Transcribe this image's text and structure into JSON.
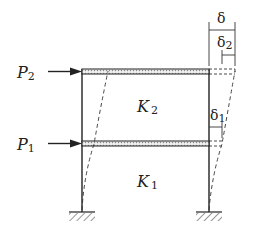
{
  "diagram": {
    "type": "two-story frame lateral deflection",
    "loads": [
      {
        "label": "P",
        "sub": "2",
        "level": "top floor"
      },
      {
        "label": "P",
        "sub": "1",
        "level": "first floor"
      }
    ],
    "stiffness": [
      {
        "label": "K",
        "sub": "2",
        "story": "upper"
      },
      {
        "label": "K",
        "sub": "1",
        "story": "lower"
      }
    ],
    "displacements": [
      {
        "label": "δ",
        "sub": "",
        "meaning": "total top displacement"
      },
      {
        "label": "δ",
        "sub": "2",
        "meaning": "upper story drift"
      },
      {
        "label": "δ",
        "sub": "1",
        "meaning": "lower story drift"
      }
    ],
    "colors": {
      "line": "#222222",
      "beam_fill": "#d9d9d9"
    }
  }
}
